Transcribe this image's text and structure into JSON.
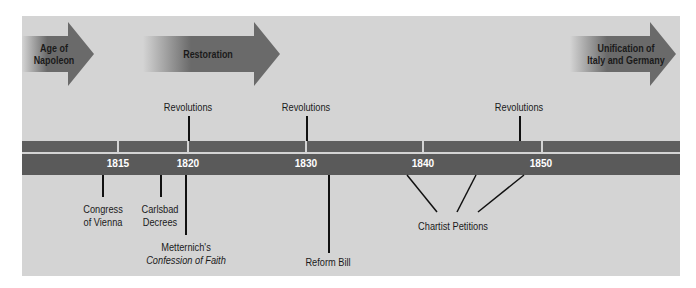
{
  "periods": [
    {
      "label_line1": "Age of",
      "label_line2": "Napoleon"
    },
    {
      "label_line1": "Restoration",
      "label_line2": ""
    },
    {
      "label_line1": "Unification of",
      "label_line2": "Italy and Germany"
    }
  ],
  "years": [
    "1815",
    "1820",
    "1830",
    "1840",
    "1850"
  ],
  "above_events": [
    "Revolutions",
    "Revolutions",
    "Revolutions"
  ],
  "below_events": {
    "congress": {
      "line1": "Congress",
      "line2": "of Vienna"
    },
    "carlsbad": {
      "line1": "Carlsbad",
      "line2": "Decrees"
    },
    "metternich": {
      "line1": "Metternich's",
      "line2": "Confession of Faith"
    },
    "reform": "Reform Bill",
    "chartist": "Chartist Petitions"
  },
  "colors": {
    "panel": "#d4d4d4",
    "bar": "#5a5a5a",
    "arrow": "#666666"
  }
}
